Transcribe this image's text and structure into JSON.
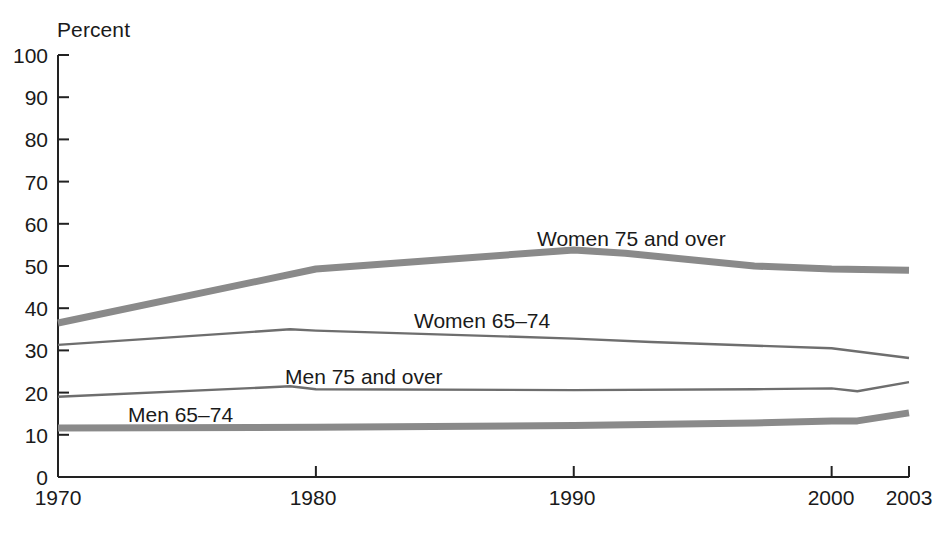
{
  "chart_data": {
    "type": "line",
    "title": "",
    "subtitle": "",
    "xlabel": "",
    "ylabel": "Percent",
    "ylim": [
      0,
      100
    ],
    "xlim": [
      1970,
      2003
    ],
    "grid": false,
    "legend_position": "inline-labels",
    "y_ticks": [
      "0",
      "10",
      "20",
      "30",
      "40",
      "50",
      "60",
      "70",
      "80",
      "90",
      "100"
    ],
    "x_ticks": [
      "1970",
      "1980",
      "1990",
      "2000",
      "2003"
    ],
    "series": [
      {
        "name": "Women 75 and over",
        "style": "thick-grey",
        "color": "#8a8a8a",
        "x": [
          1970,
          1980,
          1990,
          1992,
          1997,
          2000,
          2003
        ],
        "values": [
          36.5,
          49.3,
          53.8,
          53.0,
          50.0,
          49.3,
          49.0
        ]
      },
      {
        "name": "Women 65–74",
        "style": "thin-grey",
        "color": "#6e6e6e",
        "x": [
          1970,
          1979,
          1980,
          1990,
          1993,
          2000,
          2003
        ],
        "values": [
          31.3,
          35.0,
          34.7,
          32.8,
          32.0,
          30.5,
          28.2
        ]
      },
      {
        "name": "Men 75 and over",
        "style": "thin-grey",
        "color": "#6e6e6e",
        "x": [
          1970,
          1979,
          1980,
          1990,
          1997,
          2000,
          2001,
          2003
        ],
        "values": [
          19.0,
          21.5,
          20.8,
          20.6,
          20.8,
          21.0,
          20.3,
          22.5
        ]
      },
      {
        "name": "Men 65–74",
        "style": "thick-grey",
        "color": "#8a8a8a",
        "x": [
          1970,
          1980,
          1990,
          1997,
          2000,
          2001,
          2003
        ],
        "values": [
          11.6,
          11.8,
          12.2,
          12.8,
          13.3,
          13.3,
          15.2
        ]
      }
    ],
    "annotations": [
      {
        "text": "Women 75 and over",
        "x_px": 537,
        "y_px": 228
      },
      {
        "text": "Women 65–74",
        "x_px": 414,
        "y_px": 310
      },
      {
        "text": "Men 75 and over",
        "x_px": 285,
        "y_px": 366
      },
      {
        "text": "Men 65–74",
        "x_px": 128,
        "y_px": 404
      }
    ]
  },
  "axis": {
    "unit_label": "Percent",
    "y_labels": [
      {
        "text": "100",
        "y_px": 45
      },
      {
        "text": "90",
        "y_px": 87
      },
      {
        "text": "80",
        "y_px": 129
      },
      {
        "text": "70",
        "y_px": 172
      },
      {
        "text": "60",
        "y_px": 214
      },
      {
        "text": "50",
        "y_px": 256
      },
      {
        "text": "40",
        "y_px": 298
      },
      {
        "text": "30",
        "y_px": 340
      },
      {
        "text": "20",
        "y_px": 383
      },
      {
        "text": "10",
        "y_px": 425
      },
      {
        "text": "0",
        "y_px": 467
      }
    ],
    "x_labels": [
      {
        "text": "1970",
        "x_px": 58
      },
      {
        "text": "1980",
        "x_px": 313
      },
      {
        "text": "1990",
        "x_px": 572
      },
      {
        "text": "2000",
        "x_px": 831
      },
      {
        "text": "2003",
        "x_px": 909
      }
    ]
  }
}
